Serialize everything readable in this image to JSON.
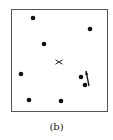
{
  "figure": {
    "caption": "(b)",
    "frame": {
      "x": 11,
      "y": 9,
      "width": 97,
      "height": 103,
      "stroke": "#555555"
    },
    "points": [
      {
        "x": 33,
        "y": 18
      },
      {
        "x": 90,
        "y": 29
      },
      {
        "x": 44,
        "y": 44
      },
      {
        "x": 21,
        "y": 74
      },
      {
        "x": 81,
        "y": 77
      },
      {
        "x": 85,
        "y": 85
      },
      {
        "x": 29,
        "y": 100
      },
      {
        "x": 61,
        "y": 101
      }
    ],
    "center_marker": {
      "symbol": "x",
      "x": 59,
      "y": 62
    },
    "arrow": {
      "x1": 86,
      "y1": 71,
      "x2": 89,
      "y2": 86
    },
    "point_color": "#111111"
  }
}
